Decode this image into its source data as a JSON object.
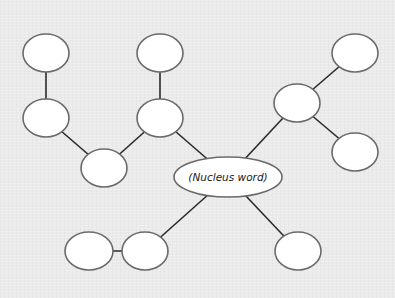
{
  "diagram": {
    "type": "bubble-map",
    "colors": {
      "background": "#ebebeb",
      "edge": "#2a2a2a",
      "node_fill": "#ffffff",
      "node_stroke": "#6a6a6a",
      "text": "#222222"
    },
    "center": {
      "id": "nucleus",
      "label": "(Nucleus word)",
      "cx": 228,
      "cy": 177,
      "rx": 54,
      "ry": 20
    },
    "nodes": [
      {
        "id": "n1",
        "cx": 46,
        "cy": 53,
        "rx": 23,
        "ry": 19,
        "label": ""
      },
      {
        "id": "n2",
        "cx": 46,
        "cy": 118,
        "rx": 23,
        "ry": 19,
        "label": ""
      },
      {
        "id": "n3",
        "cx": 104,
        "cy": 168,
        "rx": 23,
        "ry": 19,
        "label": ""
      },
      {
        "id": "n4",
        "cx": 160,
        "cy": 53,
        "rx": 23,
        "ry": 19,
        "label": ""
      },
      {
        "id": "n5",
        "cx": 160,
        "cy": 118,
        "rx": 23,
        "ry": 19,
        "label": ""
      },
      {
        "id": "n6",
        "cx": 297,
        "cy": 103,
        "rx": 23,
        "ry": 19,
        "label": ""
      },
      {
        "id": "n7",
        "cx": 355,
        "cy": 53,
        "rx": 23,
        "ry": 19,
        "label": ""
      },
      {
        "id": "n8",
        "cx": 355,
        "cy": 152,
        "rx": 23,
        "ry": 19,
        "label": ""
      },
      {
        "id": "n9",
        "cx": 89,
        "cy": 251,
        "rx": 24,
        "ry": 19,
        "label": ""
      },
      {
        "id": "n10",
        "cx": 145,
        "cy": 251,
        "rx": 23,
        "ry": 19,
        "label": ""
      },
      {
        "id": "n11",
        "cx": 298,
        "cy": 251,
        "rx": 23,
        "ry": 19,
        "label": ""
      }
    ],
    "edges": [
      {
        "from": "n1",
        "to": "n2"
      },
      {
        "from": "n2",
        "to": "n3"
      },
      {
        "from": "n3",
        "to": "n5"
      },
      {
        "from": "n4",
        "to": "n5"
      },
      {
        "from": "n5",
        "to": "nucleus"
      },
      {
        "from": "nucleus",
        "to": "n6"
      },
      {
        "from": "n6",
        "to": "n7"
      },
      {
        "from": "n6",
        "to": "n8"
      },
      {
        "from": "nucleus",
        "to": "n10"
      },
      {
        "from": "n9",
        "to": "n10"
      },
      {
        "from": "nucleus",
        "to": "n11"
      }
    ]
  }
}
